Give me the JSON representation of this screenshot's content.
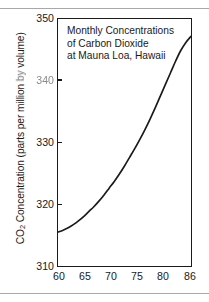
{
  "figure": {
    "background_color": "#ffffff",
    "frame_color": "#1a1a1a",
    "rule_color": "#a8a8a8"
  },
  "axis": {
    "ylabel_prefix": "CO",
    "ylabel_sub": "2",
    "ylabel_mid": " Concentration (parts per million ",
    "ylabel_smudged": "by",
    "ylabel_suffix": " volume)",
    "ylabel_full": "CO2 Concentration (parts per million by volume)",
    "xlabel": ""
  },
  "title": {
    "line1": "Monthly Concentrations",
    "line2": "of Carbon Dioxide",
    "line3": "at Mauna Loa, Hawaii"
  },
  "ticks": {
    "y": [
      {
        "label": "350",
        "value": 350,
        "degraded": false
      },
      {
        "label": "340",
        "value": 340,
        "degraded": true
      },
      {
        "label": "330",
        "value": 330,
        "degraded": false
      },
      {
        "label": "320",
        "value": 320,
        "degraded": false
      },
      {
        "label": "310",
        "value": 310,
        "degraded": false
      }
    ],
    "x": [
      {
        "label": "60",
        "value": 60
      },
      {
        "label": "65",
        "value": 65
      },
      {
        "label": "70",
        "value": 70
      },
      {
        "label": "75",
        "value": 75
      },
      {
        "label": "80",
        "value": 80
      },
      {
        "label": "86",
        "value": 86
      }
    ]
  },
  "chart_data": {
    "type": "line",
    "title": "Monthly Concentrations of Carbon Dioxide at Mauna Loa, Hawaii",
    "xlabel": "",
    "ylabel": "CO2 Concentration (parts per million by volume)",
    "xlim": [
      60,
      86
    ],
    "ylim": [
      310,
      350
    ],
    "xticks": [
      60,
      65,
      70,
      75,
      80,
      86
    ],
    "yticks": [
      310,
      320,
      330,
      340,
      350
    ],
    "grid": false,
    "legend": false,
    "line_color": "#1a1a1a",
    "series": [
      {
        "name": "CO2 concentration",
        "x": [
          60,
          61,
          62,
          63,
          64,
          65,
          66,
          67,
          68,
          69,
          70,
          71,
          72,
          73,
          74,
          75,
          76,
          77,
          78,
          79,
          80,
          81,
          82,
          83,
          84,
          85,
          86
        ],
        "values": [
          315.5,
          315.8,
          316.2,
          316.7,
          317.3,
          318.0,
          318.8,
          319.6,
          320.5,
          321.5,
          322.6,
          323.7,
          324.9,
          326.2,
          327.6,
          329.0,
          330.5,
          332.1,
          333.8,
          335.6,
          337.5,
          339.4,
          341.3,
          343.2,
          344.9,
          346.2,
          347.2
        ]
      }
    ]
  }
}
